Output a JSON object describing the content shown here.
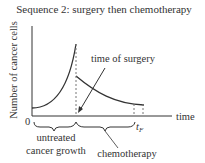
{
  "title": "Sequence 2: surgery then chemotherapy",
  "axes": {
    "ylabel": "Number of cancer cells",
    "xlabel": "time",
    "origin": "0",
    "tf_main": "t",
    "tf_sub": "F"
  },
  "annotations": {
    "surgery": "time of surgery",
    "untreated_line1": "untreated",
    "untreated_line2": "cancer growth",
    "chemo": "chemotherapy"
  },
  "colors": {
    "curve": "#333333",
    "dashed": "#777777"
  }
}
